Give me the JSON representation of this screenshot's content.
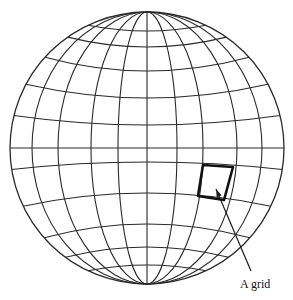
{
  "figure": {
    "type": "globe-grid-diagram",
    "colors": {
      "background": "#ffffff",
      "lines": "#2a2a2a",
      "highlight": "#111111"
    },
    "globe": {
      "center": [
        147,
        148
      ],
      "radius_x": 137,
      "radius_y": 136,
      "meridian_offsets_at_equator": [
        -115,
        -89,
        -56,
        -29,
        0,
        30,
        56,
        90,
        115
      ],
      "parallel_y_at_center": [
        31,
        47,
        71,
        98,
        125,
        148,
        162,
        193,
        224,
        247,
        265
      ]
    },
    "highlighted_cell": {
      "corners": [
        [
          203,
          165
        ],
        [
          233,
          167
        ],
        [
          224,
          200
        ],
        [
          198,
          196
        ]
      ]
    },
    "annotation": {
      "label": "A grid",
      "arrow_from": [
        251,
        271
      ],
      "arrow_to": [
        216,
        189
      ]
    }
  }
}
